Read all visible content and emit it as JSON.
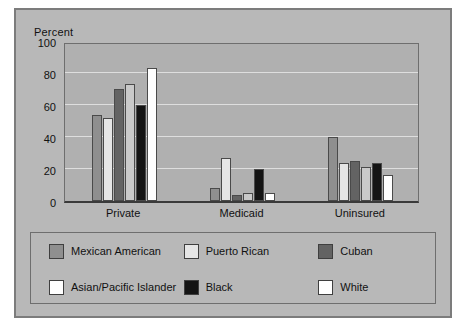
{
  "chart_data": {
    "type": "bar",
    "title": "",
    "xlabel": "",
    "ylabel": "Percent",
    "ylim": [
      0,
      100
    ],
    "yticks": [
      0,
      20,
      40,
      60,
      80,
      100
    ],
    "grid": true,
    "legend_position": "bottom",
    "categories": [
      "Private",
      "Medicaid",
      "Uninsured"
    ],
    "series": [
      {
        "name": "Mexican American",
        "color": "#8f8f8f",
        "values": [
          54,
          8,
          40
        ]
      },
      {
        "name": "Puerto Rican",
        "color": "#e6e6e6",
        "values": [
          52,
          27,
          24
        ]
      },
      {
        "name": "Cuban",
        "color": "#636363",
        "values": [
          70,
          4,
          25
        ]
      },
      {
        "name": "Asian/Pacific Islander",
        "color": "#c9c9c9",
        "values": [
          73,
          5,
          21
        ]
      },
      {
        "name": "Black",
        "color": "#141414",
        "values": [
          60,
          20,
          24
        ]
      },
      {
        "name": "White",
        "color": "#ffffff",
        "values": [
          83,
          5,
          16
        ]
      }
    ]
  },
  "legend": {
    "rows": [
      [
        {
          "label": "Mexican American",
          "color": "#8f8f8f"
        },
        {
          "label": "Puerto Rican",
          "color": "#e6e6e6"
        },
        {
          "label": "Cuban",
          "color": "#636363"
        }
      ],
      [
        {
          "label": "Asian/Pacific Islander",
          "color": "#ffffff"
        },
        {
          "label": "Black",
          "color": "#141414"
        },
        {
          "label": "White",
          "color": "#ffffff"
        }
      ]
    ]
  },
  "colors": {
    "figure_background": "#b8b8b8",
    "plot_background": "#b0b0b0",
    "gridline": "#dedede",
    "axis": "#3a3a3a",
    "text": "#111111"
  }
}
